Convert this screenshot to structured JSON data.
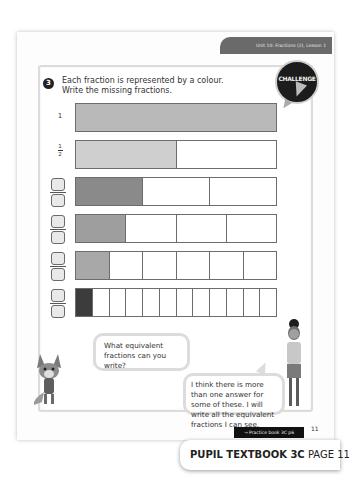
{
  "header": {
    "unit_tab": "Unit 10: Fractions (2), Lesson 1"
  },
  "challenge_badge": {
    "label": "CHALLENGE",
    "icon": "lightning-bolt-icon"
  },
  "question": {
    "number": "3",
    "line1": "Each fraction is represented by a colour.",
    "line2": "Write the missing fractions."
  },
  "bars": [
    {
      "label": "1",
      "segments": 1,
      "shaded": 1,
      "color": "#b9b9b9",
      "label_type": "whole"
    },
    {
      "label_num": "1",
      "label_den": "2",
      "segments": 2,
      "shaded": 1,
      "color": "#cfcfcf",
      "label_type": "fraction"
    },
    {
      "segments": 3,
      "shaded": 1,
      "color": "#8a8a8a",
      "label_type": "blank"
    },
    {
      "segments": 4,
      "shaded": 1,
      "color": "#9e9e9e",
      "label_type": "blank"
    },
    {
      "segments": 6,
      "shaded": 1,
      "color": "#a8a8a8",
      "label_type": "blank"
    },
    {
      "segments": 12,
      "shaded": 1,
      "color": "#3c3c3c",
      "label_type": "blank"
    }
  ],
  "speech": {
    "fox": "What equivalent fractions can you write?",
    "girl": "I think there is more than one answer for some of these. I will write all the equivalent fractions I can see."
  },
  "footer": {
    "page_number": "11",
    "practice_link": "→ Practice book 3C p6",
    "textbook_bold": "PUPIL TEXTBOOK 3C",
    "textbook_page": "PAGE 11"
  }
}
